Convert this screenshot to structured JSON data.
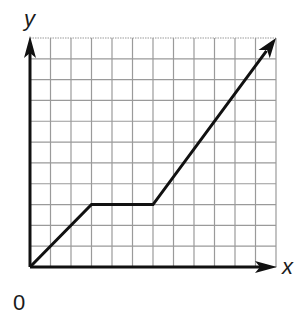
{
  "chart_data": {
    "type": "line",
    "title": "",
    "xlabel": "x",
    "ylabel": "y",
    "origin_label": "0",
    "grid": true,
    "grid_cols": 12,
    "grid_rows": 11,
    "xlim": [
      0,
      12
    ],
    "ylim": [
      0,
      11
    ],
    "tick_labels": [],
    "series": [
      {
        "name": "piecewise graph",
        "points": [
          [
            0,
            0
          ],
          [
            3,
            3
          ],
          [
            6,
            3
          ],
          [
            12,
            11
          ]
        ],
        "end_arrow": true
      }
    ]
  },
  "axes": {
    "x_label": "x",
    "y_label": "y",
    "origin": "0"
  },
  "colors": {
    "grid": "#9a9a9a",
    "line": "#111111",
    "background": "#ffffff"
  }
}
